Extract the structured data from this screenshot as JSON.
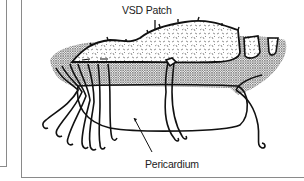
{
  "figure": {
    "labels": {
      "patch": "VSD Patch",
      "pericardium": "Pericardium"
    },
    "colors": {
      "ink": "#111111",
      "frame": "#8a8a8a",
      "stipple": "#9a9a9a",
      "background": "#ffffff"
    }
  }
}
